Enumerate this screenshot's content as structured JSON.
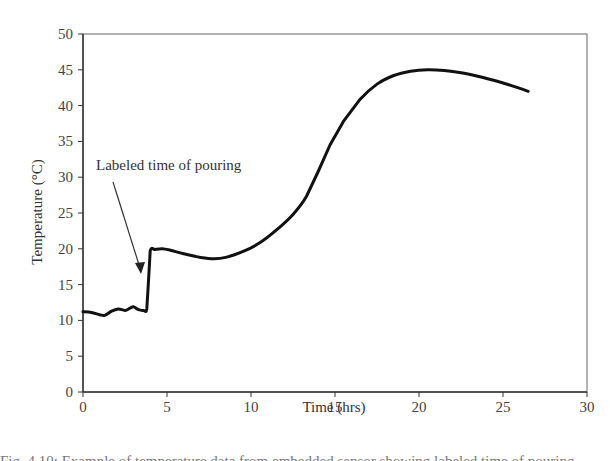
{
  "chart_data": {
    "type": "line",
    "title": "",
    "xlabel": "Time (hrs)",
    "ylabel": "Temperature (°C)",
    "xlim": [
      0,
      30
    ],
    "ylim": [
      0,
      50
    ],
    "x_ticks": [
      0,
      5,
      10,
      15,
      20,
      25,
      30
    ],
    "y_ticks": [
      0,
      5,
      10,
      15,
      20,
      25,
      30,
      35,
      40,
      45,
      50
    ],
    "grid": false,
    "legend": null,
    "series": [
      {
        "name": "Temperature",
        "color": "#111111",
        "x": [
          0.0,
          0.5,
          1.0,
          1.3,
          1.7,
          2.1,
          2.5,
          2.8,
          3.0,
          3.3,
          3.6,
          3.8,
          3.9,
          4.0,
          4.3,
          4.7,
          5.2,
          6.0,
          7.0,
          7.8,
          8.5,
          9.5,
          10.5,
          11.5,
          12.5,
          13.3,
          14.0,
          14.7,
          15.5,
          16.5,
          17.5,
          18.5,
          19.5,
          20.5,
          21.5,
          22.5,
          23.5,
          24.5,
          25.5,
          26.5
        ],
        "y": [
          11.2,
          11.1,
          10.8,
          10.7,
          11.3,
          11.6,
          11.4,
          11.7,
          11.9,
          11.5,
          11.4,
          11.6,
          15.5,
          19.7,
          19.9,
          20.0,
          19.8,
          19.3,
          18.8,
          18.6,
          18.8,
          19.6,
          20.8,
          22.6,
          24.8,
          27.3,
          30.8,
          34.5,
          37.8,
          40.9,
          43.0,
          44.2,
          44.8,
          45.0,
          44.9,
          44.6,
          44.1,
          43.5,
          42.8,
          42.0
        ]
      }
    ],
    "annotations": [
      {
        "text": "Labeled time of pouring",
        "arrow_to": {
          "x": 3.6,
          "y": 17.0
        }
      }
    ]
  },
  "labels": {
    "annotation": "Labeled time of pouring",
    "xlabel": "Time (hrs)",
    "ylabel": "Temperature (°C)"
  },
  "caption_fragment": "Fig. 4.10: Example of temperature data from embedded sensor showing labeled time of pouring"
}
